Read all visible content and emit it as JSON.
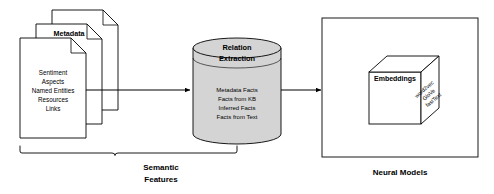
{
  "diagram": {
    "colors": {
      "stroke": "#000000",
      "page_background": "#ffffff",
      "document_fill": "#ffffff",
      "cylinder_fill": "#d4d4d4",
      "cube_fill": "#ffffff"
    },
    "documents": {
      "name": "metadata-document-stack",
      "title": "Metadata",
      "items": [
        "Sentiment",
        "Aspects",
        "Named Entities",
        "Resources",
        "Links"
      ],
      "sheet_count": 3
    },
    "cylinder": {
      "name": "relation-extraction-cylinder",
      "title_line_1": "Relation",
      "title_line_2": "Extraction",
      "items": [
        "Metadata Facts",
        "Facts from KB",
        "Inferred Facts",
        "Facts from Text"
      ]
    },
    "neural_models": {
      "name": "neural-models-panel",
      "caption": "Neural Models",
      "cube": {
        "front_label": "Embeddings",
        "side_labels": [
          "word2vec",
          "GloVe",
          "fastText"
        ]
      }
    },
    "braces": [
      {
        "name": "semantic-features-brace",
        "label_line_1": "Semantic",
        "label_line_2": "Features"
      }
    ],
    "arrows": [
      {
        "name": "arrow-documents-to-cylinder",
        "from": "metadata-document-stack",
        "to": "relation-extraction-cylinder"
      },
      {
        "name": "arrow-cylinder-to-neural-models",
        "from": "relation-extraction-cylinder",
        "to": "neural-models-panel"
      }
    ]
  }
}
